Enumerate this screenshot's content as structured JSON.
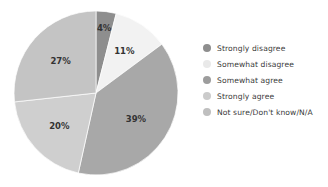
{
  "chart_data": {
    "type": "pie",
    "title": "",
    "subtitle": "",
    "xlabel": "",
    "ylabel": "",
    "grid": false,
    "legend_position": "right",
    "start_angle_clock": "12 o'clock",
    "direction": "clockwise",
    "categories": [
      "Strongly disagree",
      "Somewhat disagree",
      "Somewhat agree",
      "Strongly agree",
      "Not sure/Don't know/N/A"
    ],
    "values": [
      4,
      11,
      39,
      20,
      27
    ],
    "data_labels": [
      "4%",
      "11%",
      "39%",
      "20%",
      "27%"
    ],
    "colors": [
      "#8e8e8e",
      "#f2f2f2",
      "#a8a8a8",
      "#cfcfcf",
      "#c4c4c4"
    ],
    "slices": [
      {
        "label": "Strongly disagree",
        "value": 4,
        "data_label": "4%",
        "color": "#8e8e8e"
      },
      {
        "label": "Somewhat disagree",
        "value": 11,
        "data_label": "11%",
        "color": "#f2f2f2"
      },
      {
        "label": "Somewhat agree",
        "value": 39,
        "data_label": "39%",
        "color": "#a8a8a8"
      },
      {
        "label": "Strongly agree",
        "value": 20,
        "data_label": "20%",
        "color": "#cfcfcf"
      },
      {
        "label": "Not sure/Don't know/N/A",
        "value": 27,
        "data_label": "27%",
        "color": "#c4c4c4"
      }
    ]
  },
  "legend": {
    "items": [
      {
        "label": "Strongly disagree",
        "color": "#8e8e8e"
      },
      {
        "label": "Somewhat disagree",
        "color": "#e9e9e9"
      },
      {
        "label": "Somewhat agree",
        "color": "#9d9d9d"
      },
      {
        "label": "Strongly agree",
        "color": "#cbcbcb"
      },
      {
        "label": "Not sure/Don't know/N/A",
        "color": "#bfbfbf"
      }
    ]
  }
}
